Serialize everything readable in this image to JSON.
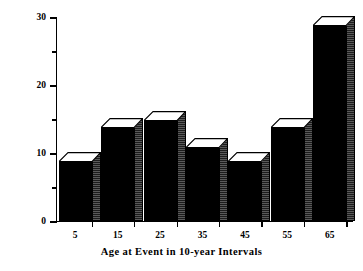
{
  "chart_data": {
    "type": "bar",
    "title": "",
    "subtitle": "",
    "xlabel": "Age at Event in 10-year Intervals",
    "ylabel": "Percent of Memories",
    "categories": [
      "5",
      "15",
      "25",
      "35",
      "45",
      "55",
      "65"
    ],
    "values": [
      9,
      14,
      15,
      11,
      9,
      14,
      29
    ],
    "series": [
      {
        "name": "Percent of Memories",
        "values": [
          9,
          14,
          15,
          11,
          9,
          14,
          29
        ]
      }
    ],
    "ylim": [
      0,
      30
    ],
    "y_major_ticks": [
      0,
      10,
      20,
      30
    ],
    "y_minor_ticks": [
      5,
      15,
      25
    ],
    "y_tick_labels": [
      "0",
      "10",
      "20",
      "30"
    ],
    "x_tick_labels": [
      "5",
      "15",
      "25",
      "35",
      "45",
      "55",
      "65"
    ],
    "grid": false,
    "legend": false,
    "legend_position": "none",
    "style": "3d-block-bars",
    "annotations": []
  },
  "colors": {
    "bar_front": "#000000",
    "bar_top": "#ffffff",
    "bar_side": "#3a3a3a",
    "outline": "#000000",
    "background": "#ffffff",
    "text": "#000000"
  }
}
